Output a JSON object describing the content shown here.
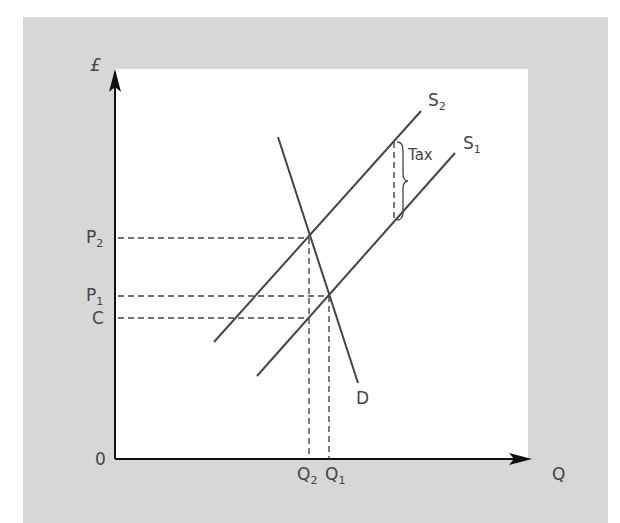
{
  "diagram": {
    "axes": {
      "y_label": "£",
      "x_label": "Q",
      "origin_label": "0"
    },
    "price_labels": {
      "p2": {
        "main": "P",
        "sub": "2"
      },
      "p1": {
        "main": "P",
        "sub": "1"
      },
      "c": {
        "main": "C",
        "sub": ""
      }
    },
    "quantity_labels": {
      "q2": {
        "main": "Q",
        "sub": "2"
      },
      "q1": {
        "main": "Q",
        "sub": "1"
      }
    },
    "curves": {
      "s2": {
        "main": "S",
        "sub": "2"
      },
      "s1": {
        "main": "S",
        "sub": "1"
      },
      "d": {
        "main": "D",
        "sub": ""
      }
    },
    "tax_label": "Tax",
    "colors": {
      "panel": "#d7d7d7",
      "plot": "#ffffff",
      "line": "#444444",
      "axis": "#111111"
    }
  }
}
